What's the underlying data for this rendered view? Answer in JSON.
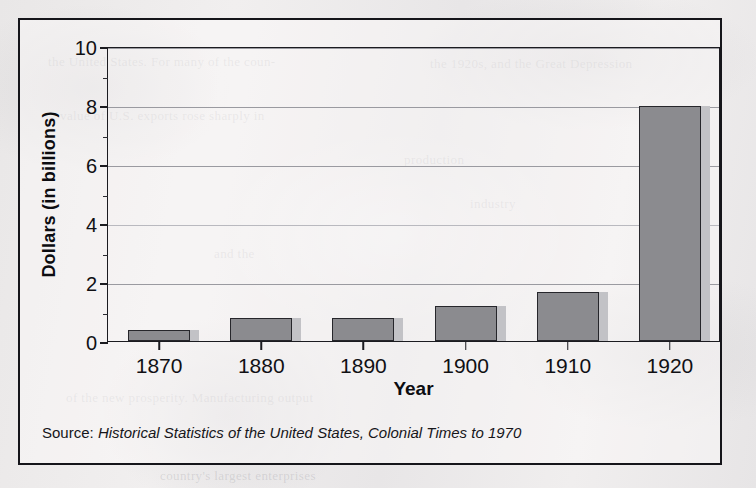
{
  "chart_data": {
    "type": "bar",
    "title": "",
    "xlabel": "Year",
    "ylabel": "Dollars (in billions)",
    "categories": [
      "1870",
      "1880",
      "1890",
      "1900",
      "1910",
      "1920"
    ],
    "values": [
      0.37,
      0.78,
      0.78,
      1.2,
      1.65,
      7.95
    ],
    "ylim": [
      0,
      10
    ],
    "yticks": [
      0,
      2,
      4,
      6,
      8,
      10
    ],
    "ytick_labels": [
      "0",
      "2",
      "4",
      "6",
      "8",
      "10"
    ],
    "y_minor_ticks": [
      1,
      3,
      5,
      7,
      9
    ],
    "grid": true,
    "grid_axis": "y",
    "legend": false,
    "bar_color": "#8b8b8f",
    "bar_edge_color": "#26262b",
    "bar_shadow_color": "#c2c2c6",
    "axis_color": "#1b1b20",
    "gridline_color": "#9a9aa0"
  },
  "source": {
    "prefix": "Source: ",
    "title": "Historical Statistics of the United States, Colonial Times to 1970"
  },
  "page_bleed": {
    "lines": [
      "the United States. For many of the coun-",
      "the 1920s, and the Great Depression",
      "value of U.S. exports rose sharply in",
      "production",
      "industry",
      "and the",
      "of the new prosperity. Manufacturing output",
      "country's largest enterprises"
    ]
  }
}
